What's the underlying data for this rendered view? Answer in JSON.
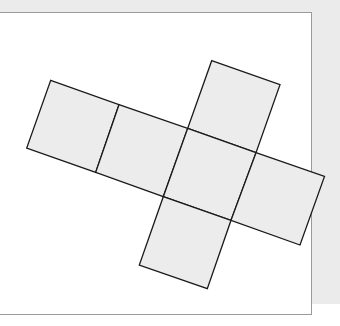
{
  "diagram": {
    "title": "",
    "type": "cube-net",
    "colors": {
      "background": "#ebebeb",
      "frame": "#ffffff",
      "frame_border": "#9a9a9a",
      "face_fill": "#ececec",
      "face_stroke": "#1a1a1a"
    },
    "faces": [
      {
        "id": "face-left",
        "points": "50.7,80.3 119,104.7 95.7,172.3 26.7,148"
      },
      {
        "id": "face-center-left",
        "points": "119,104.7 187.7,128.3 163.3,196.7 95.7,172.3"
      },
      {
        "id": "face-top",
        "points": "211.7,60.7 280,84.7 256,152.7 187.7,128.3"
      },
      {
        "id": "face-center",
        "points": "187.7,128.3 256,152.7 231,220.3 163.3,196.7"
      },
      {
        "id": "face-right",
        "points": "256,152.7 324.5,176.5 300,245 231,220.3"
      },
      {
        "id": "face-bottom",
        "points": "163.3,196.7 231,220.3 207.3,288.7 139.3,265"
      }
    ]
  }
}
